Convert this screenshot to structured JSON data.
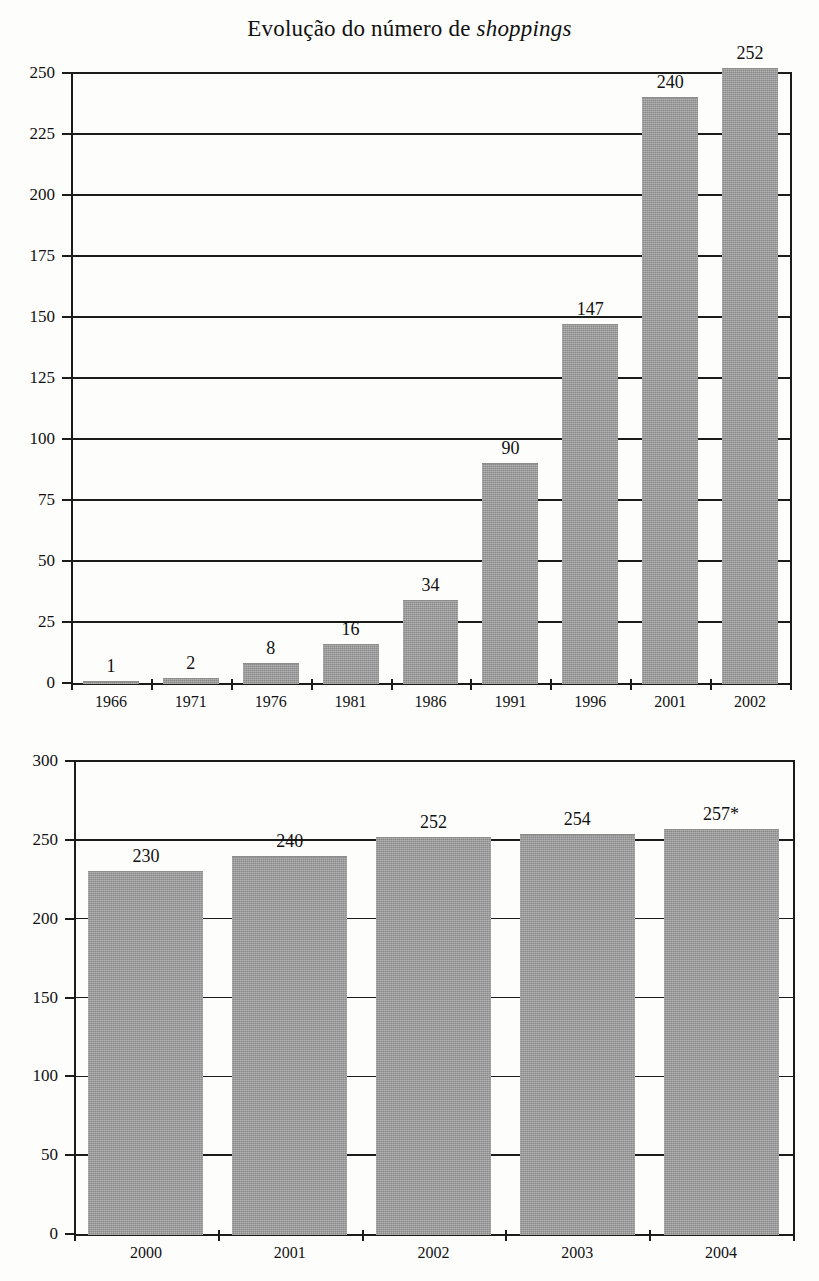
{
  "chart_data": [
    {
      "type": "bar",
      "id": "evolucao-shoppings-historico",
      "title_prefix": "Evolução do número de ",
      "title_emphasis": "shoppings",
      "title": "Evolução do número de shoppings",
      "xlabel": "",
      "ylabel": "",
      "categories": [
        "1966",
        "1971",
        "1976",
        "1981",
        "1986",
        "1991",
        "1996",
        "2001",
        "2002"
      ],
      "values": [
        1,
        2,
        8,
        16,
        34,
        90,
        147,
        240,
        252
      ],
      "data_labels": [
        "1",
        "2",
        "8",
        "16",
        "34",
        "90",
        "147",
        "240",
        "252"
      ],
      "ylim": [
        0,
        250
      ],
      "yticks": [
        0,
        25,
        50,
        75,
        100,
        125,
        150,
        175,
        200,
        225,
        250
      ],
      "ytick_labels": [
        "0",
        "25",
        "50",
        "75",
        "100",
        "125",
        "150",
        "175",
        "200",
        "225",
        "250"
      ],
      "grid": true,
      "legend": "none",
      "bar_color": "#9b9b9b"
    },
    {
      "type": "bar",
      "id": "evolucao-shoppings-recente",
      "title": "",
      "xlabel": "",
      "ylabel": "",
      "categories": [
        "2000",
        "2001",
        "2002",
        "2003",
        "2004"
      ],
      "values": [
        230,
        240,
        252,
        254,
        257
      ],
      "data_labels": [
        "230",
        "240",
        "252",
        "254",
        "257*"
      ],
      "ylim": [
        0,
        300
      ],
      "yticks": [
        0,
        50,
        100,
        150,
        200,
        250,
        300
      ],
      "ytick_labels": [
        "0",
        "50",
        "100",
        "150",
        "200",
        "250",
        "300"
      ],
      "grid": true,
      "legend": "none",
      "bar_color": "#9b9b9b",
      "footnote_marker": "*"
    }
  ]
}
